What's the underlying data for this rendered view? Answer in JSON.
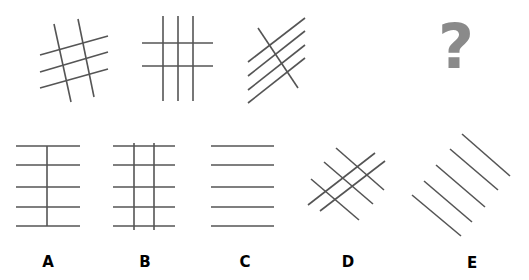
{
  "colors": {
    "line": "#555555",
    "question_mark": "#8a8a8a",
    "label": "#000000"
  },
  "sequence": {
    "figures": [
      {
        "name": "sequence-figure-1",
        "lines": [
          [
            54,
            24,
            71,
            102
          ],
          [
            78,
            19,
            94,
            97
          ],
          [
            40,
            55,
            108,
            36
          ],
          [
            40,
            72,
            108,
            52
          ],
          [
            40,
            88,
            108,
            69
          ]
        ]
      },
      {
        "name": "sequence-figure-2",
        "lines": [
          [
            163,
            16,
            163,
            101
          ],
          [
            178,
            16,
            178,
            101
          ],
          [
            193,
            16,
            193,
            101
          ],
          [
            142,
            43,
            213,
            43
          ],
          [
            142,
            66,
            213,
            66
          ]
        ]
      },
      {
        "name": "sequence-figure-3",
        "lines": [
          [
            258,
            28,
            298,
            88
          ],
          [
            248,
            62,
            305,
            18
          ],
          [
            248,
            76,
            305,
            31
          ],
          [
            248,
            90,
            305,
            45
          ],
          [
            248,
            103,
            305,
            58
          ]
        ]
      }
    ],
    "missing": {
      "symbol": "?"
    }
  },
  "options": [
    {
      "label": "A",
      "label_pos": [
        48,
        262
      ],
      "lines": [
        [
          16,
          146,
          80,
          146
        ],
        [
          16,
          165,
          80,
          165
        ],
        [
          16,
          187,
          80,
          187
        ],
        [
          16,
          207,
          80,
          207
        ],
        [
          16,
          226,
          80,
          226
        ],
        [
          47,
          146,
          47,
          226
        ]
      ]
    },
    {
      "label": "B",
      "label_pos": [
        145,
        262
      ],
      "lines": [
        [
          113,
          146,
          175,
          146
        ],
        [
          113,
          165,
          175,
          165
        ],
        [
          113,
          187,
          175,
          187
        ],
        [
          113,
          207,
          175,
          207
        ],
        [
          113,
          226,
          175,
          226
        ],
        [
          134,
          143,
          134,
          230
        ],
        [
          154,
          143,
          154,
          230
        ]
      ]
    },
    {
      "label": "C",
      "label_pos": [
        245,
        262
      ],
      "lines": [
        [
          211,
          146,
          274,
          146
        ],
        [
          211,
          165,
          274,
          165
        ],
        [
          211,
          187,
          274,
          187
        ],
        [
          211,
          207,
          274,
          207
        ],
        [
          211,
          226,
          274,
          226
        ]
      ]
    },
    {
      "label": "D",
      "label_pos": [
        348,
        262
      ],
      "lines": [
        [
          336,
          148,
          384,
          190
        ],
        [
          324,
          162,
          373,
          204
        ],
        [
          311,
          179,
          359,
          220
        ],
        [
          308,
          205,
          375,
          153
        ],
        [
          320,
          211,
          385,
          161
        ]
      ]
    },
    {
      "label": "E",
      "label_pos": [
        472,
        263
      ],
      "lines": [
        [
          462,
          134,
          510,
          176
        ],
        [
          450,
          149,
          498,
          190
        ],
        [
          436,
          165,
          485,
          207
        ],
        [
          424,
          181,
          472,
          222
        ],
        [
          412,
          195,
          461,
          236
        ]
      ]
    }
  ]
}
